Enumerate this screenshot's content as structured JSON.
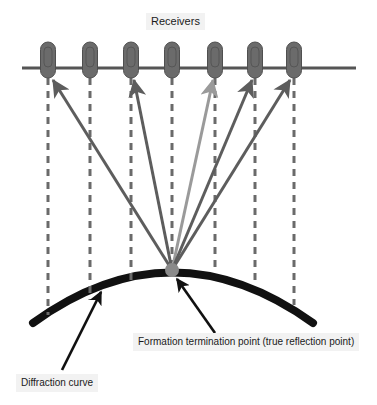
{
  "figure": {
    "title": "Receivers",
    "labels": {
      "formation_point": "Formation termination point (true reflection point)",
      "diffraction_curve": "Diffraction curve"
    }
  },
  "colors": {
    "surface_line": "#555555",
    "receiver_body": "#6b6b6b",
    "receiver_outline": "#4f4f4f",
    "ray_dark": "#5d5d5d",
    "ray_light": "#9a9a9a",
    "dashed_line": "#6a6a6a",
    "diffraction_curve": "#111111",
    "annotation_arrow": "#111111",
    "reflection_point": "#8a8a8a",
    "label_background": "#f2f2f2",
    "text": "#1a1a1a",
    "page_background": "#ffffff"
  },
  "geometry": {
    "surface_line": {
      "x1": 22,
      "y1": 68,
      "x2": 356,
      "y2": 68
    },
    "reflection_point": {
      "x": 172,
      "y": 270,
      "radius": 7
    },
    "receivers": [
      {
        "id": 1,
        "x": 48,
        "y": 68,
        "has_ray": true,
        "ray_tone": "dark"
      },
      {
        "id": 2,
        "x": 90,
        "y": 68,
        "has_ray": false,
        "ray_tone": "none"
      },
      {
        "id": 3,
        "x": 131,
        "y": 68,
        "has_ray": true,
        "ray_tone": "dark"
      },
      {
        "id": 4,
        "x": 172,
        "y": 68,
        "has_ray": false,
        "ray_tone": "none"
      },
      {
        "id": 5,
        "x": 215,
        "y": 68,
        "has_ray": true,
        "ray_tone": "light"
      },
      {
        "id": 6,
        "x": 255,
        "y": 68,
        "has_ray": true,
        "ray_tone": "dark"
      },
      {
        "id": 7,
        "x": 294,
        "y": 68,
        "has_ray": true,
        "ray_tone": "dark"
      }
    ],
    "receiver_shape": {
      "width": 15,
      "height": 36,
      "corner_radius": 7,
      "top_offset": -26
    },
    "dashed_lines": [
      {
        "x": 48,
        "y1": 78,
        "y2": 315
      },
      {
        "x": 90,
        "y1": 78,
        "y2": 300
      },
      {
        "x": 131,
        "y1": 78,
        "y2": 283
      },
      {
        "x": 172,
        "y1": 78,
        "y2": 262
      },
      {
        "x": 215,
        "y1": 78,
        "y2": 272
      },
      {
        "x": 255,
        "y1": 78,
        "y2": 286
      },
      {
        "x": 294,
        "y1": 78,
        "y2": 305
      }
    ],
    "diffraction_curve": {
      "start": {
        "x": 33,
        "y": 323
      },
      "control": {
        "x": 172,
        "y": 222
      },
      "end": {
        "x": 313,
        "y": 323
      },
      "stroke_width": 8
    },
    "annotations": [
      {
        "name": "formation-pointer",
        "from": {
          "x": 215,
          "y": 333
        },
        "to": {
          "x": 176,
          "y": 278
        }
      },
      {
        "name": "diffraction-pointer",
        "from": {
          "x": 62,
          "y": 370
        },
        "to": {
          "x": 101,
          "y": 292
        }
      }
    ]
  }
}
